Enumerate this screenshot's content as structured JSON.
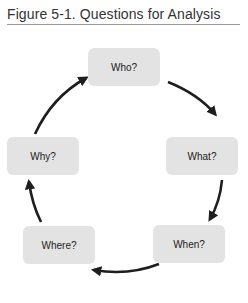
{
  "figure": {
    "caption": "Figure 5-1. Questions for Analysis"
  },
  "diagram": {
    "type": "cycle",
    "nodes": [
      {
        "id": "who",
        "label": "Who?"
      },
      {
        "id": "what",
        "label": "What?"
      },
      {
        "id": "when",
        "label": "When?"
      },
      {
        "id": "where",
        "label": "Where?"
      },
      {
        "id": "why",
        "label": "Why?"
      }
    ],
    "edges": [
      {
        "from": "who",
        "to": "what"
      },
      {
        "from": "what",
        "to": "when"
      },
      {
        "from": "when",
        "to": "where"
      },
      {
        "from": "where",
        "to": "why"
      },
      {
        "from": "why",
        "to": "who"
      }
    ],
    "colors": {
      "node_fill": "#e3e3e3",
      "arrow": "#1e1e1e",
      "rule": "#9a9a9a"
    }
  }
}
